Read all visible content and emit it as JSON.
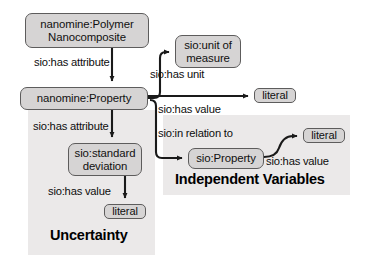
{
  "diagram": {
    "colors": {
      "background": "#ffffff",
      "panel_fill": "#ebe9e9",
      "node_fill": "#d6d4d4",
      "node_stroke": "#5d5c5c",
      "edge_stroke": "#1a1a1a",
      "text": "#101010"
    },
    "nodes": [
      {
        "id": "polymer_nanocomposite",
        "label": "nanomine:Polymer\nNanocomposite",
        "shape": "rounded-rect"
      },
      {
        "id": "nanomine_property",
        "label": "nanomine:Property",
        "shape": "rounded-rect"
      },
      {
        "id": "unit_of_measure",
        "label": "sio:unit of\nmeasure",
        "shape": "rounded-rect"
      },
      {
        "id": "literal_unit",
        "label": "literal",
        "shape": "rounded-rect"
      },
      {
        "id": "sio_property",
        "label": "sio:Property",
        "shape": "rounded-rect"
      },
      {
        "id": "literal_indep",
        "label": "literal",
        "shape": "rounded-rect"
      },
      {
        "id": "standard_deviation",
        "label": "sio:standard\ndeviation",
        "shape": "rounded-rect"
      },
      {
        "id": "literal_uncert",
        "label": "literal",
        "shape": "rounded-rect"
      }
    ],
    "edges": [
      {
        "id": "e1",
        "from": "polymer_nanocomposite",
        "to": "nanomine_property",
        "label": "sio:has attribute"
      },
      {
        "id": "e2",
        "from": "nanomine_property",
        "to": "unit_of_measure",
        "label": "sio:has unit"
      },
      {
        "id": "e3",
        "from": "nanomine_property",
        "to": "literal_unit",
        "label": "sio:has value"
      },
      {
        "id": "e4",
        "from": "nanomine_property",
        "to": "sio_property",
        "label": "sio:in relation to"
      },
      {
        "id": "e5",
        "from": "sio_property",
        "to": "literal_indep",
        "label": "sio:has value"
      },
      {
        "id": "e6",
        "from": "nanomine_property",
        "to": "standard_deviation",
        "label": "sio:has attribute"
      },
      {
        "id": "e7",
        "from": "standard_deviation",
        "to": "literal_uncert",
        "label": "sio:has value"
      }
    ],
    "groups": [
      {
        "id": "uncertainty",
        "caption": "Uncertainty"
      },
      {
        "id": "independent_variables",
        "caption": "Independent Variables"
      }
    ]
  }
}
